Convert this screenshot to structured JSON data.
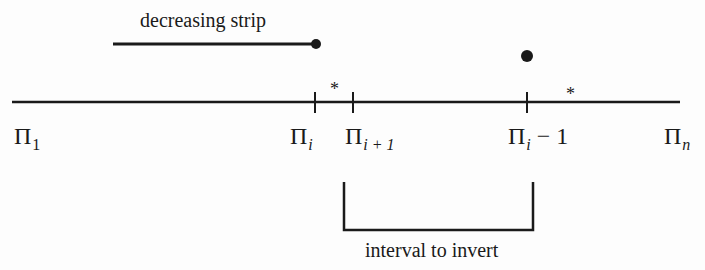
{
  "diagram": {
    "strip": {
      "label": "decreasing strip"
    },
    "markers": {
      "star_1": "*",
      "star_2": "*"
    },
    "axis_labels": {
      "pi_1": {
        "base": "Π",
        "sub": "1",
        "suffix": ""
      },
      "pi_i": {
        "base": "Π",
        "sub": "i",
        "suffix": ""
      },
      "pi_i_plus_1": {
        "base": "Π",
        "sub": "i + 1",
        "suffix": ""
      },
      "pi_i_minus_1": {
        "base": "Π",
        "sub": "i",
        "suffix": " − 1"
      },
      "pi_n": {
        "base": "Π",
        "sub": "n",
        "suffix": ""
      }
    },
    "bracket": {
      "label": "interval to invert"
    },
    "colors": {
      "ink": "#1a1a1a",
      "background": "#fdfdfd"
    }
  }
}
